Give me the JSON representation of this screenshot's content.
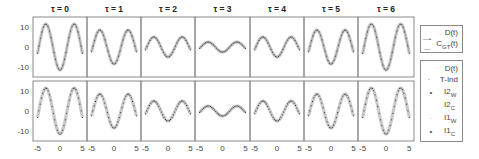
{
  "chart_data": {
    "type": "line",
    "layout": {
      "rows": 2,
      "cols": 7,
      "grid": false,
      "legend_position": "right"
    },
    "x_range": [
      -6,
      6
    ],
    "xticks": [
      -5,
      0,
      5
    ],
    "ylim": [
      -15,
      15
    ],
    "yticks": [
      10,
      0,
      -10
    ],
    "function_form": "D(t) = -A(tau) * cos(t)",
    "panels": [
      {
        "title": "τ = 0",
        "amplitude": 11.5
      },
      {
        "title": "τ = 1",
        "amplitude": 8.5
      },
      {
        "title": "τ = 2",
        "amplitude": 5.0
      },
      {
        "title": "τ = 3",
        "amplitude": 2.5
      },
      {
        "title": "τ = 4",
        "amplitude": 5.0
      },
      {
        "title": "τ = 5",
        "amplitude": 8.5
      },
      {
        "title": "τ = 6",
        "amplitude": 11.5
      }
    ],
    "rows": [
      {
        "row": "top",
        "series": [
          "D(t)",
          "C_GT(t)"
        ]
      },
      {
        "row": "bottom",
        "series": [
          "D(t)",
          "T-Ind",
          "I2_W",
          "I2_C",
          "I1_W",
          "I1_C"
        ]
      }
    ],
    "legends": [
      {
        "entries": [
          {
            "label": "D(t)",
            "marker": "none"
          },
          {
            "label": "C",
            "sub": "GT",
            "suffix": "(t)",
            "marker": "line-dot"
          }
        ]
      },
      {
        "entries": [
          {
            "label": "D(t)",
            "marker": "none"
          },
          {
            "label": "T-Ind",
            "marker": "dot"
          },
          {
            "label": "I2",
            "sub": "W",
            "marker": "dot"
          },
          {
            "label": "I2",
            "sub": "C",
            "marker": "none"
          },
          {
            "label": "I1",
            "sub": "W",
            "marker": "dot"
          },
          {
            "label": "I1",
            "sub": "C",
            "marker": "dot"
          }
        ]
      }
    ],
    "colors": {
      "band": "#c8c8c8",
      "dots": "#3a3a3a",
      "axes": "#8a8a8a"
    }
  },
  "legend1": {
    "head": "D(t)",
    "r1_label": "C",
    "r1_sub": "GT",
    "r1_suffix": "(t)",
    "r1_marker": "—•—"
  },
  "legend2": {
    "head": "D(t)",
    "rows": [
      {
        "marker": "·",
        "label": "T-Ind",
        "sub": ""
      },
      {
        "marker": "•",
        "label": "I2",
        "sub": "W"
      },
      {
        "marker": "",
        "label": "I2",
        "sub": "C"
      },
      {
        "marker": "·",
        "label": "I1",
        "sub": "W"
      },
      {
        "marker": "•",
        "label": "I1",
        "sub": "C"
      }
    ]
  }
}
